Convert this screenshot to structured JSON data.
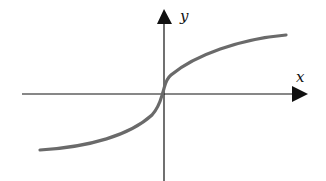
{
  "diagram": {
    "type": "function-graph",
    "axes": {
      "x_label": "x",
      "y_label": "y"
    },
    "colors": {
      "curve": "#6a6a6a",
      "axis": "#111111",
      "background": "#ffffff"
    }
  }
}
